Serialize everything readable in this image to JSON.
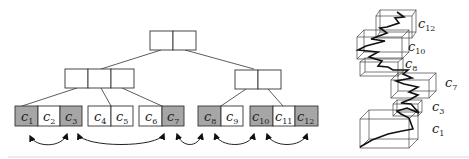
{
  "diagram": {
    "type": "b-tree-with-leaf-links-and-3d-bounding-boxes",
    "colors": {
      "shaded_leaf": "#a6a6a6",
      "plain_leaf": "#ffffff",
      "line": "#333333"
    },
    "tree": {
      "root": {
        "cells": 2
      },
      "internal": [
        {
          "name": "left",
          "cells": 3
        },
        {
          "name": "right",
          "cells": 2
        }
      ],
      "leaves": [
        {
          "group": 1,
          "cells": [
            {
              "base": "c",
              "sub": "1",
              "shaded": true
            },
            {
              "base": "c",
              "sub": "2",
              "shaded": false
            },
            {
              "base": "c",
              "sub": "3",
              "shaded": true
            }
          ]
        },
        {
          "group": 2,
          "cells": [
            {
              "base": "c",
              "sub": "4",
              "shaded": false
            },
            {
              "base": "c",
              "sub": "5",
              "shaded": false
            }
          ]
        },
        {
          "group": 3,
          "cells": [
            {
              "base": "c",
              "sub": "6",
              "shaded": false
            },
            {
              "base": "c",
              "sub": "7",
              "shaded": true
            }
          ]
        },
        {
          "group": 4,
          "cells": [
            {
              "base": "c",
              "sub": "8",
              "shaded": true
            },
            {
              "base": "c",
              "sub": "9",
              "shaded": false
            }
          ]
        },
        {
          "group": 5,
          "cells": [
            {
              "base": "c",
              "sub": "10",
              "shaded": true
            },
            {
              "base": "c",
              "sub": "11",
              "shaded": false
            },
            {
              "base": "c",
              "sub": "12",
              "shaded": true
            }
          ]
        }
      ],
      "links": [
        {
          "from": "c1",
          "to": "c3"
        },
        {
          "from": "c3",
          "to": "c7"
        },
        {
          "from": "c7",
          "to": "c8"
        },
        {
          "from": "c8",
          "to": "c10"
        },
        {
          "from": "c10",
          "to": "c12"
        }
      ]
    },
    "boxes_3d": {
      "labels": [
        {
          "base": "c",
          "sub": "12"
        },
        {
          "base": "c",
          "sub": "10"
        },
        {
          "base": "c",
          "sub": "8"
        },
        {
          "base": "c",
          "sub": "7"
        },
        {
          "base": "c",
          "sub": "3"
        },
        {
          "base": "c",
          "sub": "1"
        }
      ]
    }
  }
}
